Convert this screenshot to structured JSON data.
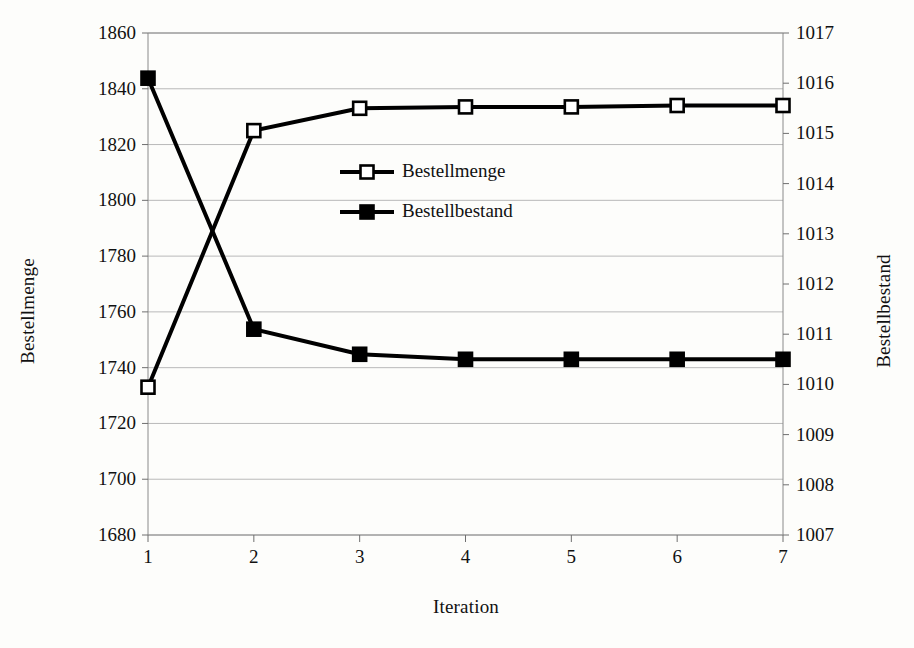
{
  "chart_data": {
    "type": "line",
    "title": "",
    "xlabel": "Iteration",
    "ylabel": "Bestellmenge",
    "ylabel_secondary": "Bestellbestand",
    "x": [
      1,
      2,
      3,
      4,
      5,
      6,
      7
    ],
    "xtick_labels": [
      "1",
      "2",
      "3",
      "4",
      "5",
      "6",
      "7"
    ],
    "xlim": [
      1,
      7
    ],
    "ylim": [
      1680,
      1860
    ],
    "ytick_labels": [
      "1860",
      "1840",
      "1820",
      "1800",
      "1780",
      "1760",
      "1740",
      "1720",
      "1700",
      "1680"
    ],
    "yticks": [
      1860,
      1840,
      1820,
      1800,
      1780,
      1760,
      1740,
      1720,
      1700,
      1680
    ],
    "ylim_secondary": [
      1007,
      1017
    ],
    "ytick_labels_secondary": [
      "1017",
      "1016",
      "1015",
      "1014",
      "1013",
      "1012",
      "1011",
      "1010",
      "1009",
      "1008",
      "1007"
    ],
    "yticks_secondary": [
      1017,
      1016,
      1015,
      1014,
      1013,
      1012,
      1011,
      1010,
      1009,
      1008,
      1007
    ],
    "grid": true,
    "legend_position": "inside-upper-center",
    "series": [
      {
        "name": "Bestellmenge",
        "axis": "left",
        "marker": "open-square",
        "color": "#000000",
        "values": [
          1733,
          1825,
          1833,
          1833.5,
          1833.5,
          1834,
          1834
        ]
      },
      {
        "name": "Bestellbestand",
        "axis": "right",
        "marker": "filled-square",
        "color": "#000000",
        "values": [
          1016.1,
          1011.1,
          1010.6,
          1010.5,
          1010.5,
          1010.5,
          1010.5
        ]
      }
    ]
  },
  "legend": {
    "items": [
      {
        "label": "Bestellmenge"
      },
      {
        "label": "Bestellbestand"
      }
    ]
  }
}
